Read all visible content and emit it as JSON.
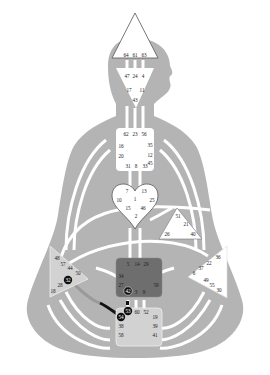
{
  "colors": {
    "background": "#ffffff",
    "body": "#b4b4b4",
    "channel": "#ffffff",
    "center_open": "#ffffff",
    "center_defined_dark": "#6e6e6e",
    "center_defined_light": "#d2d2d2",
    "outline": "#555555",
    "activated_channel": "#111111",
    "gate_circle": "#111111"
  },
  "centers": {
    "head": {
      "name": "Head",
      "state": "open",
      "gates": [
        "64",
        "61",
        "63"
      ]
    },
    "ajna": {
      "name": "Ajna",
      "state": "open",
      "gates": [
        "47",
        "24",
        "4",
        "17",
        "11",
        "43"
      ]
    },
    "throat": {
      "name": "Throat",
      "state": "open",
      "gates": [
        "62",
        "23",
        "56",
        "16",
        "35",
        "20",
        "12",
        "45",
        "31",
        "8",
        "33"
      ]
    },
    "g": {
      "name": "G Center",
      "state": "open",
      "gates": [
        "7",
        "1",
        "13",
        "10",
        "25",
        "15",
        "46",
        "2"
      ]
    },
    "heart": {
      "name": "Heart",
      "state": "open",
      "gates": [
        "51",
        "21",
        "26",
        "40"
      ]
    },
    "spleen": {
      "name": "Spleen",
      "state": "light",
      "gates": [
        "48",
        "57",
        "44",
        "50",
        "32",
        "28",
        "18"
      ],
      "circled": [
        "32"
      ]
    },
    "solar_plexus": {
      "name": "Solar Plexus",
      "state": "open",
      "gates": [
        "36",
        "22",
        "37",
        "6",
        "49",
        "55",
        "30"
      ]
    },
    "sacral": {
      "name": "Sacral",
      "state": "defined",
      "gates": [
        "5",
        "14",
        "29",
        "34",
        "27",
        "59",
        "42",
        "3",
        "9"
      ],
      "circled": [
        "42"
      ]
    },
    "root": {
      "name": "Root",
      "state": "light",
      "gates": [
        "53",
        "60",
        "52",
        "54",
        "38",
        "58",
        "19",
        "39",
        "41"
      ],
      "circled": [
        "53",
        "54"
      ]
    }
  }
}
